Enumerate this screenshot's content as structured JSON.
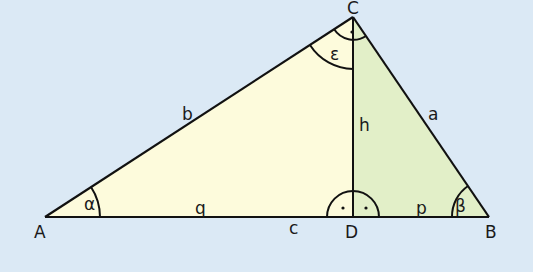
{
  "diagram": {
    "colors": {
      "background": "#dbe9f5",
      "left_fill": "#fdfbdc",
      "right_fill": "#e2efc8",
      "stroke": "#111111"
    },
    "vertices": {
      "A": {
        "label": "A",
        "x": 45,
        "y": 217
      },
      "B": {
        "label": "B",
        "x": 489,
        "y": 217
      },
      "C": {
        "label": "C",
        "x": 353,
        "y": 17
      },
      "D": {
        "label": "D",
        "x": 353,
        "y": 217
      }
    },
    "sides": {
      "a": "a",
      "b": "b",
      "c": "c",
      "h": "h",
      "p": "p",
      "q": "q"
    },
    "angles": {
      "alpha": "α",
      "beta": "β",
      "epsilon": "ε"
    }
  }
}
